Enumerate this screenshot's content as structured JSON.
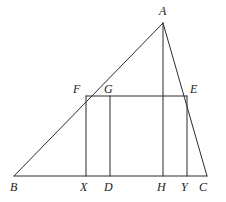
{
  "figure": {
    "type": "geometry-diagram",
    "canvas": {
      "width": 226,
      "height": 202
    },
    "style": {
      "stroke_color": "#2b2b2b",
      "stroke_width": 1,
      "background_color": "#ffffff",
      "label_color": "#1b1b1b"
    },
    "points": [
      {
        "id": "A",
        "label": "A",
        "x": 163,
        "y": 23,
        "label_x": 159,
        "label_y": 5,
        "role": "apex-vertex"
      },
      {
        "id": "B",
        "label": "B",
        "x": 14,
        "y": 176,
        "label_x": 10,
        "label_y": 181,
        "role": "base-left-vertex"
      },
      {
        "id": "C",
        "label": "C",
        "x": 207,
        "y": 176,
        "label_x": 199,
        "label_y": 181,
        "role": "base-right-vertex"
      },
      {
        "id": "F",
        "label": "F",
        "x": 86,
        "y": 96,
        "label_x": 73,
        "label_y": 83,
        "role": "rectangle-top-left"
      },
      {
        "id": "G",
        "label": "G",
        "x": 110,
        "y": 96,
        "label_x": 104,
        "label_y": 83,
        "role": "rectangle-top-interior"
      },
      {
        "id": "E",
        "label": "E",
        "x": 187,
        "y": 96,
        "label_x": 190,
        "label_y": 83,
        "role": "rectangle-top-right"
      },
      {
        "id": "X",
        "label": "X",
        "x": 86,
        "y": 176,
        "label_x": 80,
        "label_y": 181,
        "role": "base-foot-of-F"
      },
      {
        "id": "D",
        "label": "D",
        "x": 110,
        "y": 176,
        "label_x": 104,
        "label_y": 181,
        "role": "base-foot-of-G"
      },
      {
        "id": "H",
        "label": "H",
        "x": 163,
        "y": 176,
        "label_x": 157,
        "label_y": 181,
        "role": "base-foot-of-altitude"
      },
      {
        "id": "Y",
        "label": "Y",
        "x": 187,
        "y": 176,
        "label_x": 181,
        "label_y": 181,
        "role": "base-foot-of-E"
      }
    ],
    "segments": [
      {
        "id": "BA",
        "from": "B",
        "to": "A",
        "name": "side-ba"
      },
      {
        "id": "AC",
        "from": "A",
        "to": "C",
        "name": "side-ac"
      },
      {
        "id": "BC",
        "from": "B",
        "to": "C",
        "name": "base-bc"
      },
      {
        "id": "AH",
        "from": "A",
        "to": "H",
        "name": "altitude-ah"
      },
      {
        "id": "FE",
        "from": "F",
        "to": "E",
        "name": "rectangle-top-fe"
      },
      {
        "id": "FX",
        "from": "F",
        "to": "X",
        "name": "rectangle-left-fx"
      },
      {
        "id": "EY",
        "from": "E",
        "to": "Y",
        "name": "rectangle-right-ey"
      },
      {
        "id": "GD",
        "from": "G",
        "to": "D",
        "name": "interior-vertical-gd"
      }
    ]
  }
}
